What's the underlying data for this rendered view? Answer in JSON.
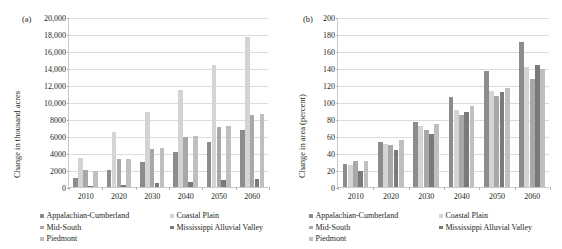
{
  "figure": {
    "series_names": [
      "Appalachian-Cumberland",
      "Coastal Plain",
      "Mid-South",
      "Mississippi Alluvial Valley",
      "Piedmont"
    ],
    "series_colors": [
      "#8c8c8c",
      "#d4d4d4",
      "#a8a8a8",
      "#7a7a7a",
      "#bfbfbf"
    ]
  },
  "panels": [
    {
      "label": "(a)",
      "ylabel": "Change in thousand acres"
    },
    {
      "label": "(b)",
      "ylabel": "Change in area (percent)"
    }
  ],
  "chart_data": [
    {
      "type": "bar",
      "panel": "(a)",
      "title": "",
      "xlabel": "",
      "ylabel": "Change in thousand acres",
      "categories": [
        "2010",
        "2020",
        "2030",
        "2040",
        "2050",
        "2060"
      ],
      "ylim": [
        0,
        20000
      ],
      "ytick_values": [
        0,
        2000,
        4000,
        6000,
        8000,
        10000,
        12000,
        14000,
        16000,
        18000,
        20000
      ],
      "ytick_labels": [
        "0",
        "2000",
        "4000",
        "6000",
        "8000",
        "10,000",
        "12,000",
        "14,000",
        "16,000",
        "18,000",
        "20,000"
      ],
      "grid": true,
      "legend_position": "bottom-left",
      "series": [
        {
          "name": "Appalachian-Cumberland",
          "values": [
            1100,
            2050,
            2980,
            4120,
            5300,
            6650
          ]
        },
        {
          "name": "Coastal Plain",
          "values": [
            3400,
            6420,
            8880,
            11420,
            14380,
            17650
          ]
        },
        {
          "name": "Mid-South",
          "values": [
            2050,
            3330,
            4500,
            5830,
            7100,
            8450
          ]
        },
        {
          "name": "Mississippi Alluvial Valley",
          "values": [
            150,
            220,
            450,
            620,
            800,
            1000
          ]
        },
        {
          "name": "Piedmont",
          "values": [
            1900,
            3340,
            4620,
            5950,
            7150,
            8600
          ]
        }
      ]
    },
    {
      "type": "bar",
      "panel": "(b)",
      "title": "",
      "xlabel": "",
      "ylabel": "Change in area (percent)",
      "categories": [
        "2010",
        "2020",
        "2030",
        "2040",
        "2050",
        "2060"
      ],
      "ylim": [
        0,
        200
      ],
      "ytick_values": [
        0,
        20,
        40,
        60,
        80,
        100,
        120,
        140,
        160,
        180,
        200
      ],
      "ytick_labels": [
        "0",
        "20",
        "40",
        "60",
        "80",
        "100",
        "120",
        "140",
        "160",
        "180",
        "200"
      ],
      "grid": true,
      "legend_position": "bottom-left",
      "series": [
        {
          "name": "Appalachian-Cumberland",
          "values": [
            27,
            53.5,
            77,
            105.5,
            136,
            171
          ]
        },
        {
          "name": "Coastal Plain",
          "values": [
            26,
            51,
            72,
            91,
            113.5,
            141
          ]
        },
        {
          "name": "Mid-South",
          "values": [
            31,
            50,
            67.5,
            85,
            107,
            127
          ]
        },
        {
          "name": "Mississippi Alluvial Valley",
          "values": [
            19,
            43,
            62,
            88,
            112,
            144
          ]
        },
        {
          "name": "Piedmont",
          "values": [
            31,
            55,
            74.5,
            95,
            116.5,
            139
          ]
        }
      ]
    }
  ]
}
